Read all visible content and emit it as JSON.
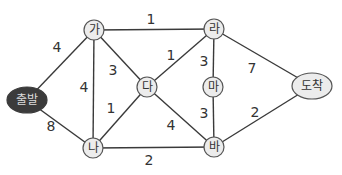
{
  "diagram": {
    "type": "weighted-undirected-graph",
    "nodes": [
      {
        "id": "start",
        "label": "출발",
        "x": 27,
        "y": 100,
        "shape": "ellipse",
        "rx": 20,
        "ry": 13,
        "fill": "#3b3b3b",
        "text_color": "#dcdcdc"
      },
      {
        "id": "ga",
        "label": "가",
        "x": 94,
        "y": 30,
        "shape": "circle",
        "r": 10
      },
      {
        "id": "na",
        "label": "나",
        "x": 93,
        "y": 148,
        "shape": "circle",
        "r": 10
      },
      {
        "id": "da",
        "label": "다",
        "x": 147,
        "y": 87,
        "shape": "circle",
        "r": 10
      },
      {
        "id": "ra",
        "label": "라",
        "x": 214,
        "y": 29,
        "shape": "circle",
        "r": 10
      },
      {
        "id": "ma",
        "label": "마",
        "x": 213,
        "y": 87,
        "shape": "circle",
        "r": 10
      },
      {
        "id": "ba",
        "label": "바",
        "x": 214,
        "y": 147,
        "shape": "circle",
        "r": 10
      },
      {
        "id": "end",
        "label": "도착",
        "x": 312,
        "y": 86,
        "shape": "ellipse",
        "rx": 20,
        "ry": 13
      }
    ],
    "edges": [
      {
        "from": "start",
        "to": "ga",
        "weight": "4",
        "label_x": 57,
        "label_y": 47
      },
      {
        "from": "start",
        "to": "na",
        "weight": "8",
        "label_x": 51,
        "label_y": 126
      },
      {
        "from": "ga",
        "to": "ra",
        "weight": "1",
        "label_x": 151,
        "label_y": 19
      },
      {
        "from": "ga",
        "to": "na",
        "weight": "4",
        "label_x": 84,
        "label_y": 87
      },
      {
        "from": "ga",
        "to": "da",
        "weight": "3",
        "label_x": 113,
        "label_y": 70
      },
      {
        "from": "da",
        "to": "ra",
        "weight": "1",
        "label_x": 171,
        "label_y": 55
      },
      {
        "from": "da",
        "to": "na",
        "weight": "1",
        "label_x": 111,
        "label_y": 108
      },
      {
        "from": "da",
        "to": "ba",
        "weight": "4",
        "label_x": 171,
        "label_y": 125
      },
      {
        "from": "ra",
        "to": "ma",
        "weight": "3",
        "label_x": 204,
        "label_y": 61
      },
      {
        "from": "ma",
        "to": "ba",
        "weight": "3",
        "label_x": 204,
        "label_y": 113
      },
      {
        "from": "ra",
        "to": "end",
        "weight": "7",
        "label_x": 252,
        "label_y": 68
      },
      {
        "from": "na",
        "to": "ba",
        "weight": "2",
        "label_x": 149,
        "label_y": 160
      },
      {
        "from": "ba",
        "to": "end",
        "weight": "2",
        "label_x": 255,
        "label_y": 112
      }
    ],
    "colors": {
      "edge": "#3a3a3a",
      "node_fill": "#ececec",
      "node_stroke": "#555555",
      "start_fill": "#3b3b3b",
      "text": "#333333"
    }
  }
}
